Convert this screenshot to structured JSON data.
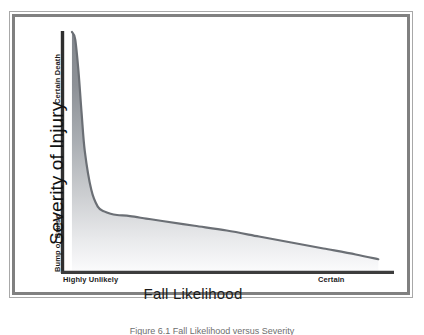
{
  "figure": {
    "caption": "Figure 6.1  Fall Likelihood versus Severity"
  },
  "chart_data": {
    "type": "area",
    "title": "",
    "xlabel": "Fall Likelihood",
    "ylabel": "Severity of Injury",
    "x_tick_labels": [
      "Highly Unlikely",
      "Certain"
    ],
    "y_tick_labels": [
      "Bump or Bruise",
      "Certain Death"
    ],
    "grid": false,
    "legend": "none",
    "xlim": [
      0,
      100
    ],
    "ylim": [
      0,
      100
    ],
    "axis_color": "#3d3d3d",
    "curve_color": "#6b6f75",
    "fill_top_color": "#8c9096",
    "fill_bottom_color": "#fbfbfc",
    "annotations": [
      "Severity of injury falls off sharply as fall likelihood increases, then declines slowly to near zero at Certain."
    ],
    "x": [
      2,
      3,
      4,
      5,
      6,
      8,
      10,
      12,
      14,
      16,
      20,
      25,
      30,
      40,
      50,
      60,
      70,
      80,
      90,
      97
    ],
    "values": [
      100,
      97,
      84,
      66,
      50,
      34,
      27,
      25,
      24,
      23.5,
      23,
      22,
      21,
      19,
      17,
      14.5,
      12,
      9.5,
      7,
      5
    ],
    "series": [
      {
        "name": "Severity of Injury",
        "values": [
          100,
          97,
          84,
          66,
          50,
          34,
          27,
          25,
          24,
          23.5,
          23,
          22,
          21,
          19,
          17,
          14.5,
          12,
          9.5,
          7,
          5
        ]
      }
    ]
  }
}
